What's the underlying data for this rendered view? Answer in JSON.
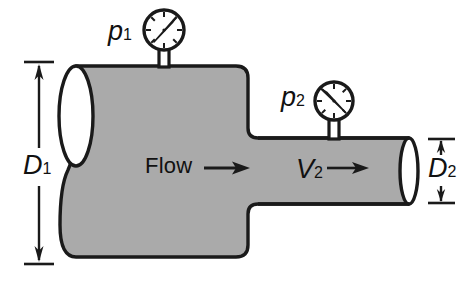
{
  "figure": {
    "background_color": "#ffffff",
    "fluid_fill_color": "#aaaaaa",
    "outline_color": "#1a1a1a",
    "text_color": "#111111"
  },
  "labels": {
    "pressure_1": "p",
    "pressure_1_sub": "1",
    "pressure_2": "p",
    "pressure_2_sub": "2",
    "diameter_1": "D",
    "diameter_1_sub": "1",
    "diameter_2": "D",
    "diameter_2_sub": "2",
    "flow": "Flow",
    "velocity_2": "V",
    "velocity_2_sub": "2"
  },
  "gauges": [
    {
      "name": "gauge-p1",
      "label": "p1",
      "center_x": 164,
      "center_y": 30,
      "radius": 20,
      "needle_angle_deg": -55,
      "tick_count": 8
    },
    {
      "name": "gauge-p2",
      "label": "p2",
      "center_x": 334,
      "center_y": 101,
      "radius": 19,
      "needle_angle_deg": -140,
      "tick_count": 8
    }
  ],
  "dimensions": [
    {
      "name": "D1",
      "label": "D",
      "subscript": "1",
      "orientation": "vertical",
      "x": 38,
      "y_top": 63,
      "y_bottom": 263
    },
    {
      "name": "D2",
      "label": "D",
      "subscript": "2",
      "orientation": "vertical",
      "x": 441,
      "y_top": 140,
      "y_bottom": 201
    }
  ],
  "arrows": [
    {
      "name": "flow-arrow",
      "x_start": 205,
      "x_end": 248,
      "y": 168
    },
    {
      "name": "v2-arrow",
      "x_start": 327,
      "x_end": 368,
      "y": 168
    }
  ],
  "geometry": {
    "large_pipe": {
      "top": 66,
      "bottom": 257,
      "left": 72,
      "right": 248
    },
    "small_pipe": {
      "top": 138,
      "bottom": 204,
      "left": 248,
      "right": 410
    },
    "left_opening_ellipse": {
      "cx": 76,
      "cy": 116,
      "rx": 17,
      "ry": 50
    },
    "right_opening_ellipse": {
      "cx": 409,
      "cy": 171,
      "rx": 9,
      "ry": 32
    }
  }
}
